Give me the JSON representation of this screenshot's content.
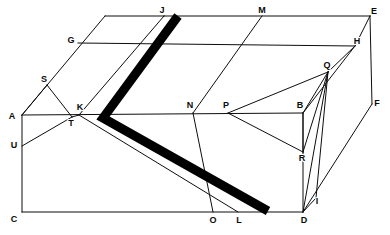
{
  "figure": {
    "type": "line-diagram",
    "canvas": {
      "width": 390,
      "height": 235
    },
    "colors": {
      "background": "#ffffff",
      "line": "#0d0d0d",
      "band": "#000000",
      "label": "#0a0a0a"
    },
    "band": {
      "name": "thick-chevron-band",
      "stroke_width": 9,
      "path_points": [
        {
          "x": 178,
          "y": 16
        },
        {
          "x": 103,
          "y": 118
        },
        {
          "x": 268,
          "y": 211
        }
      ]
    },
    "vertices": [
      {
        "id": "A",
        "label": "A",
        "x": 22,
        "y": 115,
        "label_x": 12,
        "label_y": 117
      },
      {
        "id": "B",
        "label": "B",
        "x": 303,
        "y": 113,
        "label_x": 300,
        "label_y": 106
      },
      {
        "id": "C",
        "label": "C",
        "x": 22,
        "y": 212,
        "label_x": 14,
        "label_y": 220
      },
      {
        "id": "D",
        "label": "D",
        "x": 303,
        "y": 212,
        "label_x": 304,
        "label_y": 221
      },
      {
        "id": "E",
        "label": "E",
        "x": 370,
        "y": 16,
        "label_x": 374,
        "label_y": 12
      },
      {
        "id": "F",
        "label": "F",
        "x": 372,
        "y": 104,
        "label_x": 377,
        "label_y": 104
      },
      {
        "id": "G",
        "label": "G",
        "x": 78,
        "y": 43,
        "label_x": 71,
        "label_y": 41
      },
      {
        "id": "H",
        "label": "H",
        "x": 355,
        "y": 46,
        "label_x": 357,
        "label_y": 42
      },
      {
        "id": "I",
        "label": "I",
        "x": 316,
        "y": 198,
        "label_x": 317,
        "label_y": 202
      },
      {
        "id": "J",
        "label": "J",
        "x": 164,
        "y": 16,
        "label_x": 162,
        "label_y": 11
      },
      {
        "id": "K",
        "label": "K",
        "x": 79,
        "y": 115,
        "label_x": 80,
        "label_y": 108
      },
      {
        "id": "L",
        "label": "L",
        "x": 238,
        "y": 212,
        "label_x": 239,
        "label_y": 221
      },
      {
        "id": "M",
        "label": "M",
        "x": 262,
        "y": 16,
        "label_x": 262,
        "label_y": 11
      },
      {
        "id": "N",
        "label": "N",
        "x": 193,
        "y": 113,
        "label_x": 190,
        "label_y": 106
      },
      {
        "id": "O",
        "label": "O",
        "x": 213,
        "y": 212,
        "label_x": 213,
        "label_y": 221
      },
      {
        "id": "P",
        "label": "P",
        "x": 228,
        "y": 113,
        "label_x": 226,
        "label_y": 106
      },
      {
        "id": "Q",
        "label": "Q",
        "x": 328,
        "y": 72,
        "label_x": 327,
        "label_y": 66
      },
      {
        "id": "R",
        "label": "R",
        "x": 303,
        "y": 152,
        "label_x": 302,
        "label_y": 159
      },
      {
        "id": "S",
        "label": "S",
        "x": 47,
        "y": 85,
        "label_x": 44,
        "label_y": 80
      },
      {
        "id": "T",
        "label": "T",
        "x": 72,
        "y": 117,
        "label_x": 71,
        "label_y": 124
      },
      {
        "id": "U",
        "label": "U",
        "x": 22,
        "y": 146,
        "label_x": 14,
        "label_y": 146
      }
    ],
    "edges": [
      {
        "name": "edge-A-C",
        "from": "A",
        "to": "C"
      },
      {
        "name": "edge-C-D",
        "from": "C",
        "to": "D"
      },
      {
        "name": "edge-D-B",
        "from": "D",
        "to": "B"
      },
      {
        "name": "edge-A-B",
        "from": "A",
        "to": "B"
      },
      {
        "name": "edge-A-topleft",
        "from": "A",
        "to": "topleft"
      },
      {
        "name": "edge-topleft-J",
        "from": "topleft",
        "to": "J"
      },
      {
        "name": "edge-J-E",
        "from": "J",
        "to": "E"
      },
      {
        "name": "edge-E-H",
        "from": "E",
        "to": "H"
      },
      {
        "name": "edge-E-F",
        "from": "E",
        "to": "F"
      },
      {
        "name": "edge-F-D",
        "from": "F",
        "to": "D"
      },
      {
        "name": "edge-B-H",
        "from": "B",
        "to": "H"
      },
      {
        "name": "edge-G-H",
        "from": "G",
        "to": "H"
      },
      {
        "name": "edge-S-A",
        "from": "S",
        "to": "A"
      },
      {
        "name": "edge-S-T",
        "from": "S",
        "to": "T"
      },
      {
        "name": "edge-U-T",
        "from": "U",
        "to": "T"
      },
      {
        "name": "edge-T-K",
        "from": "T",
        "to": "K"
      },
      {
        "name": "edge-K-J",
        "from": "K",
        "to": "J"
      },
      {
        "name": "edge-K-L",
        "from": "K",
        "to": "L"
      },
      {
        "name": "edge-N-M",
        "from": "N",
        "to": "M"
      },
      {
        "name": "edge-N-O",
        "from": "N",
        "to": "O"
      },
      {
        "name": "edge-P-Q",
        "from": "P",
        "to": "Q"
      },
      {
        "name": "edge-P-R",
        "from": "P",
        "to": "R"
      },
      {
        "name": "edge-Q-B",
        "from": "Q",
        "to": "B"
      },
      {
        "name": "edge-Q-R",
        "from": "Q",
        "to": "R"
      },
      {
        "name": "edge-Q-H",
        "from": "Q",
        "to": "H"
      },
      {
        "name": "edge-Q-D",
        "from": "Q",
        "to": "D"
      },
      {
        "name": "edge-Q-I",
        "from": "Q",
        "to": "I"
      },
      {
        "name": "edge-D-I",
        "from": "D",
        "to": "I"
      },
      {
        "name": "edge-B-R",
        "from": "B",
        "to": "R"
      }
    ]
  }
}
